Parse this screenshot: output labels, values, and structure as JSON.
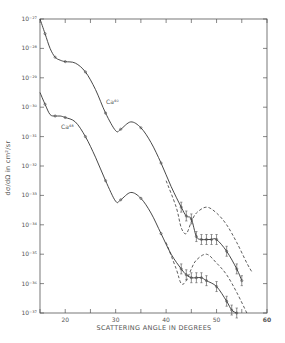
{
  "chart_data": {
    "type": "line",
    "title": "",
    "xlabel": "SCATTERING ANGLE IN DEGREES",
    "ylabel": "dσ/dΩ in cm²/sr",
    "xlim": [
      15,
      60
    ],
    "ylim_log10": [
      -37,
      -27
    ],
    "x_ticks": [
      20,
      30,
      40,
      50,
      60
    ],
    "x_tick_labels": [
      "20",
      "30",
      "40",
      "50",
      "60"
    ],
    "y_ticks_log10": [
      -27,
      -28,
      -29,
      -30,
      -31,
      -32,
      -33,
      -34,
      -35,
      -36,
      -37
    ],
    "y_tick_labels": [
      "10⁻²⁷",
      "10⁻²⁸",
      "10⁻²⁹",
      "10⁻³⁰",
      "10⁻³¹",
      "10⁻³²",
      "10⁻³³",
      "10⁻³⁴",
      "10⁻³⁵",
      "10⁻³⁶",
      "10⁻³⁷"
    ],
    "grid": false,
    "legend": "inline labels",
    "series": [
      {
        "name": "Ca40",
        "label": "Ca⁴⁰",
        "style": "solid fit with data points",
        "x": [
          15,
          16,
          17,
          18,
          19,
          20,
          22,
          24,
          26,
          28,
          30,
          31,
          33,
          35,
          37,
          39,
          41,
          43,
          44,
          45,
          46,
          47,
          48,
          49,
          50,
          52,
          54,
          55
        ],
        "log10_y": [
          -27.0,
          -27.5,
          -28.0,
          -28.3,
          -28.4,
          -28.45,
          -28.5,
          -28.8,
          -29.4,
          -30.2,
          -30.8,
          -30.75,
          -30.5,
          -30.7,
          -31.2,
          -31.9,
          -32.7,
          -33.4,
          -33.7,
          -33.8,
          -34.4,
          -34.5,
          -34.5,
          -34.5,
          -34.5,
          -34.9,
          -35.5,
          -35.9
        ]
      },
      {
        "name": "Ca40 dashed",
        "style": "dashed",
        "x": [
          40,
          42,
          43,
          44,
          45,
          46,
          48,
          50,
          52,
          54,
          56,
          57
        ],
        "log10_y": [
          -32.5,
          -33.4,
          -34.1,
          -34.3,
          -33.9,
          -33.6,
          -33.4,
          -33.6,
          -34.0,
          -34.6,
          -35.3,
          -35.6
        ]
      },
      {
        "name": "Ca48",
        "label": "Ca⁴⁸",
        "style": "solid fit with data points",
        "x": [
          15,
          16,
          17,
          18,
          19,
          20,
          22,
          24,
          26,
          28,
          30,
          31,
          33,
          35,
          37,
          39,
          41,
          43,
          44,
          45,
          46,
          47,
          48,
          50,
          52,
          53,
          54
        ],
        "log10_y": [
          -29.5,
          -29.9,
          -30.25,
          -30.3,
          -30.3,
          -30.35,
          -30.5,
          -31.0,
          -31.7,
          -32.5,
          -33.2,
          -33.15,
          -32.9,
          -33.1,
          -33.6,
          -34.3,
          -35.0,
          -35.5,
          -35.7,
          -35.8,
          -35.8,
          -35.8,
          -35.9,
          -36.1,
          -36.6,
          -36.9,
          -37.0
        ]
      },
      {
        "name": "Ca48 dashed",
        "style": "dashed",
        "x": [
          40,
          42,
          43,
          44,
          45,
          46,
          48,
          50,
          52,
          54,
          56
        ],
        "log10_y": [
          -34.6,
          -35.5,
          -36.0,
          -35.9,
          -35.5,
          -35.2,
          -35.0,
          -35.3,
          -35.7,
          -36.3,
          -37.0
        ]
      }
    ]
  }
}
